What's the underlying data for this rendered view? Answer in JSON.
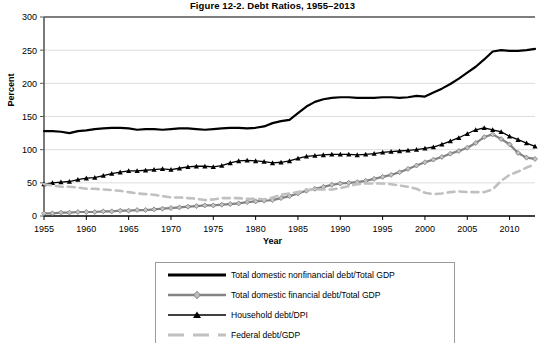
{
  "chart_data": {
    "type": "line",
    "title": "Figure 12-2. Debt Ratios, 1955–2013",
    "xlabel": "Year",
    "ylabel": "Percent",
    "ylim": [
      0,
      300
    ],
    "xlim": [
      1955,
      2013
    ],
    "yticks": [
      0,
      50,
      100,
      150,
      200,
      250,
      300
    ],
    "xticks": [
      1955,
      1960,
      1965,
      1970,
      1975,
      1980,
      1985,
      1990,
      1995,
      2000,
      2005,
      2010
    ],
    "grid": true,
    "legend_position": "below-center",
    "x": [
      1955,
      1956,
      1957,
      1958,
      1959,
      1960,
      1961,
      1962,
      1963,
      1964,
      1965,
      1966,
      1967,
      1968,
      1969,
      1970,
      1971,
      1972,
      1973,
      1974,
      1975,
      1976,
      1977,
      1978,
      1979,
      1980,
      1981,
      1982,
      1983,
      1984,
      1985,
      1986,
      1987,
      1988,
      1989,
      1990,
      1991,
      1992,
      1993,
      1994,
      1995,
      1996,
      1997,
      1998,
      1999,
      2000,
      2001,
      2002,
      2003,
      2004,
      2005,
      2006,
      2007,
      2008,
      2009,
      2010,
      2011,
      2012,
      2013
    ],
    "series": [
      {
        "name": "Total domestic nonfinancial debt/Total GDP",
        "color": "#000000",
        "style": "solid",
        "width": 2.2,
        "marker": "none",
        "values": [
          128,
          128,
          127,
          125,
          128,
          129,
          131,
          132,
          133,
          133,
          132,
          130,
          131,
          131,
          130,
          131,
          132,
          132,
          131,
          130,
          131,
          132,
          133,
          133,
          132,
          133,
          135,
          140,
          143,
          145,
          155,
          165,
          172,
          176,
          178,
          179,
          179,
          178,
          178,
          178,
          179,
          179,
          178,
          179,
          181,
          180,
          186,
          192,
          199,
          207,
          216,
          225,
          236,
          248,
          250,
          249,
          249,
          250,
          252
        ]
      },
      {
        "name": "Total domestic financial debt/Total GDP",
        "color": "#848484",
        "style": "solid",
        "width": 2.2,
        "marker": "diamond",
        "values": [
          4,
          4,
          5,
          5,
          6,
          6,
          6,
          7,
          7,
          8,
          8,
          9,
          9,
          10,
          11,
          12,
          13,
          14,
          15,
          16,
          16,
          17,
          18,
          19,
          21,
          22,
          23,
          24,
          27,
          30,
          34,
          38,
          41,
          44,
          47,
          49,
          50,
          51,
          53,
          56,
          59,
          62,
          66,
          71,
          76,
          81,
          85,
          89,
          94,
          98,
          103,
          110,
          119,
          123,
          116,
          108,
          95,
          88,
          86
        ]
      },
      {
        "name": "Household debt/DPI",
        "color": "#000000",
        "style": "solid",
        "width": 1.3,
        "marker": "triangle",
        "values": [
          48,
          50,
          51,
          52,
          55,
          57,
          58,
          61,
          64,
          66,
          68,
          68,
          69,
          70,
          71,
          70,
          72,
          74,
          75,
          75,
          74,
          76,
          80,
          83,
          84,
          83,
          82,
          80,
          81,
          83,
          87,
          90,
          91,
          92,
          93,
          93,
          93,
          92,
          93,
          94,
          96,
          97,
          98,
          99,
          100,
          102,
          104,
          108,
          113,
          118,
          124,
          130,
          133,
          130,
          127,
          120,
          115,
          110,
          105
        ]
      },
      {
        "name": "Federal debt/GDP",
        "color": "#c0c0c0",
        "style": "dashed",
        "width": 2.6,
        "marker": "none",
        "values": [
          48,
          46,
          44,
          44,
          43,
          41,
          41,
          40,
          39,
          38,
          36,
          34,
          33,
          32,
          30,
          28,
          28,
          27,
          26,
          24,
          25,
          27,
          27,
          27,
          26,
          26,
          25,
          28,
          32,
          34,
          36,
          39,
          40,
          40,
          40,
          42,
          45,
          48,
          49,
          49,
          49,
          48,
          46,
          44,
          41,
          35,
          33,
          34,
          36,
          37,
          36,
          36,
          36,
          40,
          53,
          62,
          67,
          73,
          78
        ]
      }
    ]
  },
  "legend": {
    "items": [
      {
        "label": "Total domestic nonfinancial debt/Total GDP"
      },
      {
        "label": "Total domestic financial debt/Total GDP"
      },
      {
        "label": "Household debt/DPI"
      },
      {
        "label": "Federal debt/GDP"
      }
    ]
  }
}
